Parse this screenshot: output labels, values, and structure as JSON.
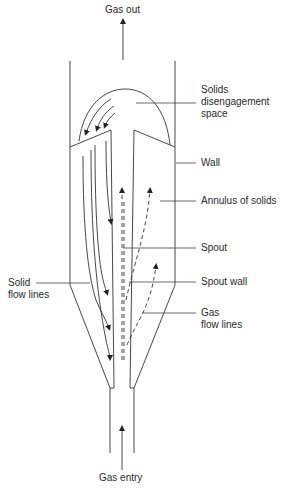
{
  "diagram": {
    "labels": {
      "gas_out": "Gas out",
      "solids_disengagement_line1": "Solids",
      "solids_disengagement_line2": "disengagement",
      "solids_disengagement_line3": "space",
      "wall": "Wall",
      "annulus": "Annulus of solids",
      "spout": "Spout",
      "spout_wall": "Spout wall",
      "gas_flow_line1": "Gas",
      "gas_flow_line2": "flow lines",
      "solid_flow_line1": "Solid",
      "solid_flow_line2": "flow lines",
      "gas_entry": "Gas entry"
    },
    "colors": {
      "line": "#333333",
      "text": "#2a2a2a",
      "background": "#ffffff"
    }
  }
}
